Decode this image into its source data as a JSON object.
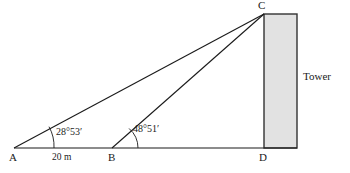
{
  "figure": {
    "type": "geometry-diagram",
    "vertices": {
      "A": "A",
      "B": "B",
      "C": "C",
      "D": "D"
    },
    "angles": {
      "at_A": "28°53′",
      "at_B": "48°51′"
    },
    "distances": {
      "AB": "20 m"
    },
    "objects": {
      "tower": "Tower"
    },
    "colors": {
      "stroke": "#1a1a1a",
      "tower_fill": "#e2e2e2",
      "tower_stroke": "#333333",
      "background": "#ffffff"
    },
    "geometry": {
      "baseline": {
        "x1": 14,
        "y1": 148,
        "x2": 297,
        "y2": 148
      },
      "point_A": {
        "x": 14,
        "y": 148
      },
      "point_B": {
        "x": 112,
        "y": 148
      },
      "point_C": {
        "x": 264,
        "y": 14
      },
      "point_D": {
        "x": 264,
        "y": 148
      },
      "tower_rect": {
        "x": 264,
        "y": 14,
        "width": 33,
        "height": 134
      },
      "arc_A_radius": 40,
      "arc_B_radius": 26
    }
  }
}
